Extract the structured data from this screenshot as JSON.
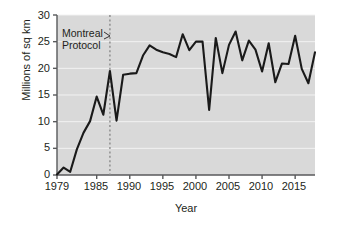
{
  "chart_data": {
    "type": "line",
    "title": "",
    "subtitle": "",
    "xlabel": "Year",
    "ylabel": "Millions of sq km",
    "xlim": [
      1979,
      2018
    ],
    "ylim": [
      0,
      30
    ],
    "grid": "horizontal",
    "legend": "none",
    "xticks": [
      1979,
      1985,
      1990,
      1995,
      2000,
      2005,
      2010,
      2015
    ],
    "xtick_labels": [
      "1979",
      "1985",
      "1990",
      "1995",
      "2000",
      "2005",
      "2010",
      "2015"
    ],
    "yticks": [
      0,
      5,
      10,
      15,
      20,
      25,
      30
    ],
    "ytick_labels": [
      "0",
      "5",
      "10",
      "15",
      "20",
      "25",
      "30"
    ],
    "series": [
      {
        "name": "Ozone hole area",
        "color": "#1a1a1a",
        "x": [
          1979,
          1980,
          1981,
          1982,
          1983,
          1984,
          1985,
          1986,
          1987,
          1988,
          1989,
          1990,
          1991,
          1992,
          1993,
          1994,
          1995,
          1996,
          1997,
          1998,
          1999,
          2000,
          2001,
          2002,
          2003,
          2004,
          2005,
          2006,
          2007,
          2008,
          2009,
          2010,
          2011,
          2012,
          2013,
          2014,
          2015,
          2016,
          2017,
          2018
        ],
        "values": [
          0.1,
          1.4,
          0.6,
          4.8,
          7.9,
          10.1,
          14.7,
          11.3,
          19.5,
          10.2,
          18.8,
          19.0,
          19.1,
          22.4,
          24.3,
          23.5,
          23.0,
          22.7,
          22.1,
          26.4,
          23.4,
          25.0,
          25.0,
          12.2,
          25.7,
          19.1,
          24.4,
          26.9,
          21.5,
          25.2,
          23.5,
          19.4,
          24.7,
          17.4,
          20.9,
          20.8,
          26.1,
          19.9,
          17.2,
          23.0
        ]
      }
    ],
    "annotations": [
      {
        "name": "montreal-protocol",
        "line1": "Montreal",
        "line2": "Protocol",
        "marker_x": 1987,
        "marker_style": "dashed-vertical",
        "marker_color": "#8a8a8a"
      }
    ],
    "plot_background": "#d9d9d9",
    "gridline_color": "#f2f2f2",
    "axis_color": "#58595b"
  }
}
